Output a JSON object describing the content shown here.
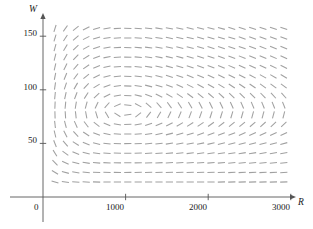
{
  "figure": {
    "type": "direction-field",
    "background_color": "#ffffff",
    "axis_color": "#555555",
    "field_color": "#a0a0a0",
    "text_color": "#1a1a1a"
  },
  "axes": {
    "x": {
      "label": "R",
      "origin_label": "0",
      "ticks": [
        {
          "value": 1000,
          "label": "1000"
        },
        {
          "value": 2000,
          "label": "2000"
        },
        {
          "value": 3000,
          "label": "3000"
        }
      ],
      "range": [
        0,
        3100
      ],
      "pixel_origin": 43,
      "pixel_per_unit": 0.0826,
      "axis_pixel_y": 197,
      "arrow_end_x": 291
    },
    "y": {
      "label": "W",
      "ticks": [
        {
          "value": 50,
          "label": "50"
        },
        {
          "value": 100,
          "label": "100"
        },
        {
          "value": 150,
          "label": "150"
        }
      ],
      "range": [
        0,
        165
      ],
      "pixel_origin": 197,
      "pixel_per_unit": 1.072,
      "axis_pixel_x": 43,
      "arrow_end_y": 18
    }
  },
  "chart_data": {
    "type": "quiver",
    "title": "",
    "xlabel": "R",
    "ylabel": "W",
    "xlim": [
      0,
      3100
    ],
    "ylim": [
      0,
      165
    ],
    "grid": false,
    "legend": null,
    "model": "lotka-volterra-predator-prey",
    "equilibrium": {
      "R": 1000,
      "W": 80
    },
    "parameters": {
      "a": 0.08,
      "b": 0.001,
      "c": 0.02,
      "d": 2e-05
    },
    "segment": {
      "length_px": 7.2,
      "line_width_px": 1.05,
      "color": "#a0a0a0",
      "has_arrowhead": false
    },
    "sample_grid": {
      "x_start": 55,
      "x_count": 23,
      "x_step_px": 10.4,
      "y_start_px": 182,
      "y_count": 17,
      "y_step_px": -9.6
    }
  }
}
